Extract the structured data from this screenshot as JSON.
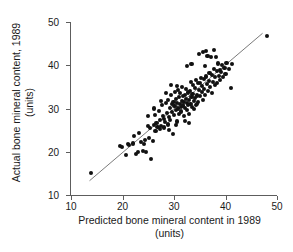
{
  "chart_data": {
    "type": "scatter",
    "title": "",
    "xlabel": "Predicted bone mineral content in 1989 (units)",
    "ylabel": "Actual bone mineral content, 1989 (units)",
    "xlabel_line1": "Predicted bone mineral content in 1989",
    "xlabel_line2": "(units)",
    "ylabel_line1": "Actual bone mineral content, 1989",
    "ylabel_line2": "(units)",
    "xlim": [
      10,
      50
    ],
    "ylim": [
      10,
      50
    ],
    "xticks": [
      10,
      20,
      30,
      40,
      50
    ],
    "yticks": [
      10,
      20,
      30,
      40,
      50
    ],
    "xticklabels": [
      "10",
      "20",
      "30",
      "40",
      "50"
    ],
    "yticklabels": [
      "10",
      "20",
      "30",
      "40",
      "50"
    ],
    "grid": false,
    "legend": false,
    "marker": "filled-circle",
    "marker_color": "#111111",
    "axis_color": "#5d5d5d",
    "reference_line": {
      "label": "identity/regression line",
      "color": "#6b6b6b",
      "x1": 13.6,
      "y1": 13.3,
      "x2": 47.2,
      "y2": 47.4
    },
    "n_points": 152,
    "points": [
      [
        13.8,
        15.0
      ],
      [
        19.6,
        21.4
      ],
      [
        19.9,
        21.0
      ],
      [
        20.6,
        19.3
      ],
      [
        21.0,
        21.7
      ],
      [
        21.2,
        21.5
      ],
      [
        22.0,
        21.9
      ],
      [
        22.3,
        23.7
      ],
      [
        22.6,
        19.5
      ],
      [
        23.0,
        20.0
      ],
      [
        23.2,
        24.3
      ],
      [
        23.6,
        22.2
      ],
      [
        23.9,
        20.1
      ],
      [
        24.1,
        21.8
      ],
      [
        24.4,
        22.8
      ],
      [
        24.6,
        20.0
      ],
      [
        24.9,
        26.0
      ],
      [
        25.2,
        23.1
      ],
      [
        25.4,
        25.4
      ],
      [
        25.6,
        18.4
      ],
      [
        25.9,
        22.5
      ],
      [
        26.1,
        26.2
      ],
      [
        26.3,
        28.6
      ],
      [
        26.4,
        24.7
      ],
      [
        26.6,
        26.6
      ],
      [
        26.8,
        25.8
      ],
      [
        27.0,
        29.5
      ],
      [
        27.2,
        25.3
      ],
      [
        27.3,
        27.3
      ],
      [
        27.5,
        26.0
      ],
      [
        27.6,
        30.9
      ],
      [
        27.8,
        28.2
      ],
      [
        28.0,
        27.6
      ],
      [
        28.1,
        25.6
      ],
      [
        28.3,
        26.8
      ],
      [
        28.5,
        31.2
      ],
      [
        28.6,
        29.0
      ],
      [
        28.8,
        32.0
      ],
      [
        28.9,
        26.3
      ],
      [
        29.0,
        28.1
      ],
      [
        29.2,
        30.2
      ],
      [
        29.3,
        27.4
      ],
      [
        29.5,
        33.2
      ],
      [
        29.6,
        31.0
      ],
      [
        29.7,
        29.1
      ],
      [
        29.8,
        24.0
      ],
      [
        29.9,
        31.6
      ],
      [
        30.0,
        28.4
      ],
      [
        30.1,
        30.6
      ],
      [
        30.2,
        33.8
      ],
      [
        30.3,
        32.2
      ],
      [
        30.4,
        29.7
      ],
      [
        30.5,
        31.3
      ],
      [
        30.6,
        27.0
      ],
      [
        30.7,
        34.3
      ],
      [
        30.8,
        30.0
      ],
      [
        30.9,
        32.6
      ],
      [
        31.0,
        28.8
      ],
      [
        31.1,
        31.1
      ],
      [
        31.2,
        33.5
      ],
      [
        31.3,
        30.4
      ],
      [
        31.4,
        29.3
      ],
      [
        31.5,
        31.8
      ],
      [
        31.6,
        35.0
      ],
      [
        31.7,
        32.9
      ],
      [
        31.8,
        30.7
      ],
      [
        31.9,
        28.2
      ],
      [
        32.0,
        31.5
      ],
      [
        32.1,
        33.1
      ],
      [
        32.2,
        30.1
      ],
      [
        32.3,
        34.6
      ],
      [
        32.4,
        32.3
      ],
      [
        32.5,
        29.6
      ],
      [
        32.6,
        31.2
      ],
      [
        32.7,
        33.7
      ],
      [
        32.8,
        30.8
      ],
      [
        32.9,
        32.0
      ],
      [
        33.0,
        28.7
      ],
      [
        33.1,
        34.0
      ],
      [
        33.2,
        31.0
      ],
      [
        33.3,
        36.2
      ],
      [
        33.4,
        32.7
      ],
      [
        33.5,
        30.3
      ],
      [
        33.6,
        33.4
      ],
      [
        33.7,
        35.4
      ],
      [
        33.8,
        31.7
      ],
      [
        33.9,
        29.8
      ],
      [
        34.0,
        34.8
      ],
      [
        34.1,
        32.4
      ],
      [
        34.2,
        36.6
      ],
      [
        34.3,
        30.9
      ],
      [
        34.5,
        33.0
      ],
      [
        34.6,
        35.8
      ],
      [
        34.7,
        31.4
      ],
      [
        34.9,
        34.2
      ],
      [
        35.0,
        36.0
      ],
      [
        35.1,
        32.8
      ],
      [
        35.2,
        37.0
      ],
      [
        35.4,
        33.8
      ],
      [
        35.5,
        35.2
      ],
      [
        35.6,
        31.9
      ],
      [
        35.8,
        36.8
      ],
      [
        35.9,
        34.5
      ],
      [
        36.0,
        39.8
      ],
      [
        36.1,
        33.2
      ],
      [
        36.3,
        37.4
      ],
      [
        36.4,
        35.6
      ],
      [
        36.5,
        42.2
      ],
      [
        36.6,
        34.0
      ],
      [
        36.8,
        36.4
      ],
      [
        36.9,
        38.2
      ],
      [
        37.0,
        35.0
      ],
      [
        37.2,
        41.9
      ],
      [
        37.3,
        37.8
      ],
      [
        37.4,
        33.6
      ],
      [
        37.6,
        36.2
      ],
      [
        37.7,
        39.2
      ],
      [
        37.8,
        43.5
      ],
      [
        37.9,
        35.4
      ],
      [
        38.0,
        37.2
      ],
      [
        38.2,
        42.0
      ],
      [
        38.3,
        38.6
      ],
      [
        38.4,
        36.0
      ],
      [
        38.6,
        40.4
      ],
      [
        38.7,
        37.6
      ],
      [
        38.9,
        39.0
      ],
      [
        39.0,
        36.6
      ],
      [
        39.2,
        38.4
      ],
      [
        39.4,
        40.0
      ],
      [
        39.6,
        37.2
      ],
      [
        39.8,
        39.4
      ],
      [
        40.0,
        38.0
      ],
      [
        40.2,
        40.6
      ],
      [
        40.6,
        39.2
      ],
      [
        41.0,
        34.8
      ],
      [
        41.2,
        40.2
      ],
      [
        34.8,
        42.6
      ],
      [
        35.6,
        43.0
      ],
      [
        36.2,
        43.4
      ],
      [
        33.4,
        40.2
      ],
      [
        32.6,
        39.9
      ],
      [
        29.4,
        35.5
      ],
      [
        28.4,
        33.6
      ],
      [
        27.4,
        31.8
      ],
      [
        26.2,
        30.0
      ],
      [
        25.0,
        28.2
      ],
      [
        32.2,
        27.2
      ],
      [
        33.0,
        26.6
      ],
      [
        30.4,
        26.1
      ],
      [
        29.0,
        25.1
      ],
      [
        34.4,
        31.0
      ],
      [
        48.0,
        46.7
      ],
      [
        30.6,
        35.2
      ]
    ]
  }
}
